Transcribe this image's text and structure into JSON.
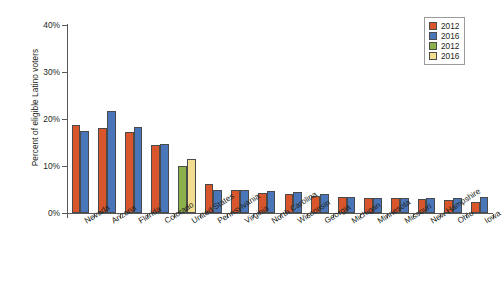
{
  "chart_data": {
    "type": "bar",
    "title": "",
    "xlabel": "",
    "ylabel": "Percent of eligible Latino voters",
    "ylim": [
      0,
      40
    ],
    "ytick_labels": [
      "0%",
      "10%",
      "20%",
      "30%",
      "40%"
    ],
    "ytick_values": [
      0,
      10,
      20,
      30,
      40
    ],
    "grid": false,
    "legend_position": "top-right",
    "categories": [
      "Nevada",
      "Arizona",
      "Florida",
      "Colorado",
      "United States",
      "Pennsylvania",
      "Virginia",
      "North Carolina",
      "Wisconsin",
      "Georgia",
      "Michigan",
      "Minnesota",
      "Missouri",
      "New Hampshire",
      "Ohio",
      "Iowa"
    ],
    "series": [
      {
        "name": "2012",
        "color": "#d9562c",
        "values": [
          18.8,
          18.0,
          17.2,
          14.4,
          null,
          6.2,
          4.9,
          4.2,
          4.0,
          3.7,
          3.4,
          3.2,
          3.1,
          3.0,
          2.7,
          2.4
        ]
      },
      {
        "name": "2016",
        "color": "#4876b8",
        "values": [
          17.5,
          21.6,
          18.2,
          14.6,
          null,
          4.8,
          5.0,
          4.6,
          4.5,
          4.1,
          3.5,
          3.3,
          3.2,
          3.2,
          3.1,
          3.4
        ]
      },
      {
        "name": "2012",
        "color": "#8cb04a",
        "values": [
          null,
          null,
          null,
          null,
          10.1,
          null,
          null,
          null,
          null,
          null,
          null,
          null,
          null,
          null,
          null,
          null
        ]
      },
      {
        "name": "2016",
        "color": "#f2dd8e",
        "values": [
          null,
          null,
          null,
          null,
          11.4,
          null,
          null,
          null,
          null,
          null,
          null,
          null,
          null,
          null,
          null,
          null
        ]
      }
    ]
  },
  "legend": {
    "entries": [
      {
        "label": "2012",
        "color": "#d9562c",
        "name": "legend-item-2012-state"
      },
      {
        "label": "2016",
        "color": "#4876b8",
        "name": "legend-item-2016-state"
      },
      {
        "label": "2012",
        "color": "#8cb04a",
        "name": "legend-item-2012-us"
      },
      {
        "label": "2016",
        "color": "#f2dd8e",
        "name": "legend-item-2016-us"
      }
    ]
  },
  "colors": {
    "series_2012_state": "#d9562c",
    "series_2016_state": "#4876b8",
    "series_2012_us": "#8cb04a",
    "series_2016_us": "#f2dd8e",
    "axis": "#58595b",
    "text": "#231f20",
    "background": "#ffffff"
  }
}
